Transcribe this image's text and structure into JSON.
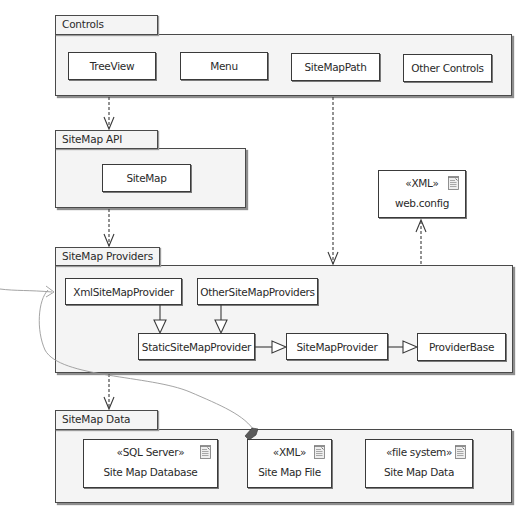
{
  "diagram": {
    "type": "UML package diagram",
    "colors": {
      "line": "#3a3a3a",
      "package_fill": "#f4f4f4",
      "box_fill": "#ffffff",
      "annotation_line": "#9a9a9a"
    },
    "packages": {
      "controls": {
        "label": "Controls",
        "items": [
          {
            "label": "TreeView"
          },
          {
            "label": "Menu"
          },
          {
            "label": "SiteMapPath"
          },
          {
            "label": "Other Controls"
          }
        ]
      },
      "api": {
        "label": "SiteMap API",
        "items": [
          {
            "label": "SiteMap"
          }
        ]
      },
      "providers": {
        "label": "SiteMap Providers",
        "items": [
          {
            "label": "XmlSiteMapProvider"
          },
          {
            "label": "OtherSiteMapProviders"
          },
          {
            "label": "StaticSiteMapProvider"
          },
          {
            "label": "SiteMapProvider"
          },
          {
            "label": "ProviderBase"
          }
        ]
      },
      "data": {
        "label": "SiteMap Data",
        "items": [
          {
            "stereotype": "«SQL Server»",
            "label": "Site Map Database",
            "icon": "document-icon"
          },
          {
            "stereotype": "«XML»",
            "label": "Site Map File",
            "icon": "document-icon"
          },
          {
            "stereotype": "«file system»",
            "label": "Site Map Data",
            "icon": "document-icon"
          }
        ]
      }
    },
    "config_artifact": {
      "stereotype": "«XML»",
      "label": "web.config",
      "icon": "document-icon"
    },
    "relationships": [
      {
        "from": "Controls",
        "to": "SiteMap API",
        "kind": "dependency"
      },
      {
        "from": "SiteMapPath",
        "to": "SiteMap Providers",
        "kind": "dependency"
      },
      {
        "from": "SiteMap API",
        "to": "SiteMap Providers",
        "kind": "dependency"
      },
      {
        "from": "SiteMap Providers",
        "to": "web.config",
        "kind": "dependency"
      },
      {
        "from": "SiteMap Providers",
        "to": "SiteMap Data",
        "kind": "dependency"
      },
      {
        "from": "XmlSiteMapProvider",
        "to": "StaticSiteMapProvider",
        "kind": "generalization"
      },
      {
        "from": "OtherSiteMapProviders",
        "to": "StaticSiteMapProvider",
        "kind": "generalization"
      },
      {
        "from": "StaticSiteMapProvider",
        "to": "SiteMapProvider",
        "kind": "generalization"
      },
      {
        "from": "SiteMapProvider",
        "to": "ProviderBase",
        "kind": "generalization"
      }
    ]
  }
}
